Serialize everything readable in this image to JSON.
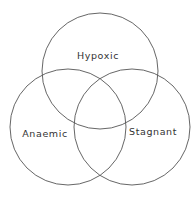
{
  "diagram": {
    "type": "venn",
    "sets": [
      {
        "label": "Hypoxic",
        "cx": 100,
        "cy": 71,
        "r": 58,
        "label_x": 98,
        "label_y": 59
      },
      {
        "label": "Anaemic",
        "cx": 68,
        "cy": 127,
        "r": 58,
        "label_x": 45,
        "label_y": 137
      },
      {
        "label": "Stagnant",
        "cx": 132,
        "cy": 127,
        "r": 58,
        "label_x": 153,
        "label_y": 135
      }
    ],
    "stroke_color": "#555555",
    "background": "#ffffff"
  }
}
